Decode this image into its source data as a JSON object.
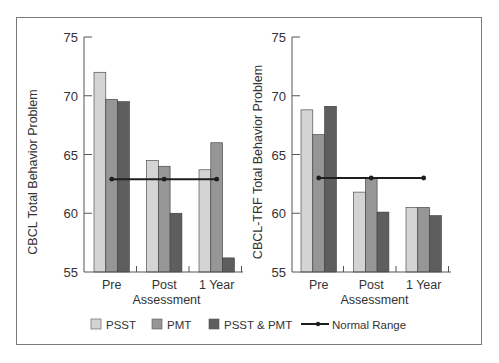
{
  "chart_data": [
    {
      "type": "bar",
      "title": "",
      "xlabel": "Assessment",
      "ylabel": "CBCL Total Behavior Problem",
      "categories": [
        "Pre",
        "Post",
        "1 Year"
      ],
      "ylim": [
        55,
        75
      ],
      "yticks": [
        55,
        60,
        65,
        70,
        75
      ],
      "grid": false,
      "series": [
        {
          "name": "PSST",
          "values": [
            72.0,
            64.5,
            63.7
          ]
        },
        {
          "name": "PMT",
          "values": [
            69.7,
            64.0,
            66.0
          ]
        },
        {
          "name": "PSST & PMT",
          "values": [
            69.5,
            60.0,
            56.2
          ]
        }
      ],
      "reference_line": {
        "name": "Normal Range",
        "values": [
          62.9,
          62.9,
          62.9
        ]
      }
    },
    {
      "type": "bar",
      "title": "",
      "xlabel": "Assessment",
      "ylabel": "CBCL-TRF Total Behavior Problem",
      "categories": [
        "Pre",
        "Post",
        "1 Year"
      ],
      "ylim": [
        55,
        75
      ],
      "yticks": [
        55,
        60,
        65,
        70,
        75
      ],
      "grid": false,
      "series": [
        {
          "name": "PSST",
          "values": [
            68.8,
            61.8,
            60.5
          ]
        },
        {
          "name": "PMT",
          "values": [
            66.7,
            63.0,
            60.5
          ]
        },
        {
          "name": "PSST & PMT",
          "values": [
            69.1,
            60.1,
            59.8
          ]
        }
      ],
      "reference_line": {
        "name": "Normal Range",
        "values": [
          63.0,
          63.0,
          63.0
        ]
      }
    }
  ],
  "legend": {
    "position": "bottom",
    "items": [
      {
        "label": "PSST",
        "type": "box",
        "color": "#d4d4d4"
      },
      {
        "label": "PMT",
        "type": "box",
        "color": "#969696"
      },
      {
        "label": "PSST & PMT",
        "type": "box",
        "color": "#5e5e5e"
      },
      {
        "label": "Normal Range",
        "type": "line",
        "color": "#1e1e1e"
      }
    ]
  },
  "colors": {
    "PSST": "#d4d4d4",
    "PMT": "#969696",
    "PSST & PMT": "#5e5e5e",
    "normal_line": "#1e1e1e",
    "axis": "#555555",
    "frame": "#7a7a7a"
  }
}
